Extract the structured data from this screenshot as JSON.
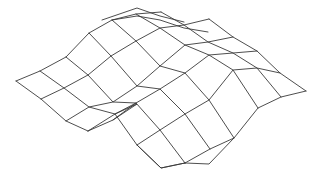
{
  "figure": {
    "background": "#ffffff",
    "line_color": "#3a3a3a"
  },
  "mesh": {
    "polylines": [
      [
        [
          16,
          81
        ],
        [
          40,
          71
        ],
        [
          66,
          57
        ],
        [
          89,
          33
        ],
        [
          112,
          20
        ],
        [
          136,
          14
        ],
        [
          161,
          12
        ]
      ],
      [
        [
          41,
          99
        ],
        [
          64,
          88
        ],
        [
          88,
          75
        ],
        [
          111,
          56
        ],
        [
          136,
          41
        ],
        [
          160,
          28
        ],
        [
          184,
          25
        ],
        [
          209,
          19
        ]
      ],
      [
        [
          66,
          121
        ],
        [
          89,
          107
        ],
        [
          113,
          102
        ],
        [
          137,
          86
        ],
        [
          160,
          66
        ],
        [
          185,
          45
        ],
        [
          208,
          42
        ],
        [
          233,
          37
        ]
      ],
      [
        [
          88,
          131
        ],
        [
          115,
          114
        ],
        [
          136,
          103
        ],
        [
          160,
          89
        ],
        [
          185,
          73
        ],
        [
          209,
          55
        ],
        [
          233,
          53
        ],
        [
          257,
          51
        ]
      ],
      [
        [
          137,
          145
        ],
        [
          160,
          130
        ],
        [
          185,
          114
        ],
        [
          209,
          100
        ],
        [
          233,
          70
        ],
        [
          257,
          68
        ],
        [
          280,
          73
        ]
      ],
      [
        [
          185,
          163
        ],
        [
          210,
          149
        ],
        [
          234,
          138
        ],
        [
          258,
          108
        ],
        [
          281,
          97
        ],
        [
          306,
          91
        ]
      ],
      [
        [
          185,
          163
        ],
        [
          209,
          164
        ],
        [
          234,
          138
        ]
      ],
      [
        [
          16,
          81
        ],
        [
          41,
          99
        ],
        [
          66,
          121
        ],
        [
          88,
          131
        ]
      ],
      [
        [
          40,
          71
        ],
        [
          64,
          88
        ],
        [
          89,
          107
        ],
        [
          115,
          114
        ],
        [
          137,
          145
        ],
        [
          161,
          168
        ],
        [
          185,
          163
        ]
      ],
      [
        [
          66,
          57
        ],
        [
          88,
          75
        ],
        [
          113,
          102
        ],
        [
          136,
          103
        ],
        [
          160,
          130
        ],
        [
          185,
          163
        ]
      ],
      [
        [
          89,
          33
        ],
        [
          111,
          56
        ],
        [
          137,
          86
        ],
        [
          160,
          89
        ],
        [
          185,
          114
        ],
        [
          210,
          149
        ]
      ],
      [
        [
          112,
          20
        ],
        [
          136,
          41
        ],
        [
          160,
          66
        ],
        [
          185,
          73
        ],
        [
          209,
          100
        ],
        [
          234,
          138
        ]
      ],
      [
        [
          136,
          14
        ],
        [
          160,
          28
        ],
        [
          185,
          45
        ],
        [
          209,
          55
        ],
        [
          233,
          70
        ],
        [
          258,
          108
        ]
      ],
      [
        [
          161,
          12
        ],
        [
          184,
          25
        ],
        [
          208,
          42
        ],
        [
          233,
          53
        ],
        [
          257,
          68
        ],
        [
          281,
          97
        ]
      ],
      [
        [
          209,
          19
        ],
        [
          233,
          37
        ],
        [
          257,
          51
        ],
        [
          280,
          73
        ],
        [
          306,
          91
        ]
      ],
      [
        [
          137,
          145
        ],
        [
          161,
          168
        ],
        [
          185,
          163
        ]
      ],
      [
        [
          115,
          114
        ],
        [
          137,
          104
        ],
        [
          113,
          120
        ],
        [
          88,
          131
        ]
      ],
      [
        [
          136,
          103
        ],
        [
          113,
          120
        ]
      ],
      [
        [
          102,
          20
        ],
        [
          137,
          8
        ],
        [
          160,
          16
        ],
        [
          184,
          22
        ]
      ],
      [
        [
          112,
          20
        ],
        [
          137,
          16
        ],
        [
          160,
          20
        ],
        [
          184,
          28
        ],
        [
          208,
          32
        ]
      ]
    ]
  }
}
